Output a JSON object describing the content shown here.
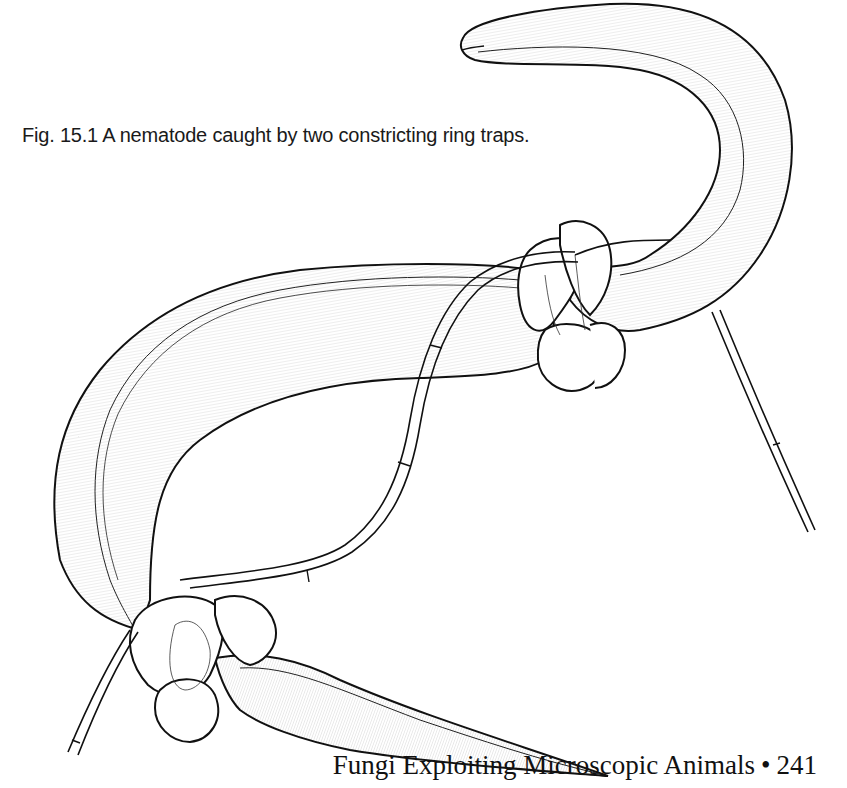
{
  "figure": {
    "caption": "Fig. 15.1 A nematode caught by two constricting ring traps.",
    "illustration": "nematode-ring-trap-drawing"
  },
  "footer": {
    "running_title": "Fungi Exploiting Microscopic Animals",
    "separator": "•",
    "page_number": "241"
  },
  "colors": {
    "ink": "#111111",
    "paper": "#ffffff"
  }
}
